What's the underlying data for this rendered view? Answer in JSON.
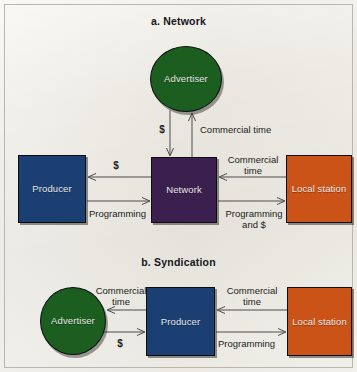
{
  "figure": {
    "background_color": "#eceae2",
    "panels": [
      {
        "id": "network",
        "title": "a. Network",
        "nodes": [
          {
            "id": "advertiser",
            "label": "Advertiser",
            "shape": "circle",
            "color": "#1b5e20"
          },
          {
            "id": "producer",
            "label": "Producer",
            "shape": "rect",
            "color": "#1c3f73"
          },
          {
            "id": "network",
            "label": "Network",
            "shape": "rect",
            "color": "#3b1f4e"
          },
          {
            "id": "local_station",
            "label": "Local\nstation",
            "shape": "rect",
            "color": "#cc5317"
          }
        ],
        "edges": [
          {
            "id": "network-to-advertiser-money",
            "label": "$",
            "from": "network",
            "to": "advertiser",
            "direction": "down"
          },
          {
            "id": "advertiser-to-network-commercial-time",
            "label": "Commercial time",
            "from": "advertiser",
            "to": "network",
            "direction": "up"
          },
          {
            "id": "network-to-producer-money",
            "label": "$",
            "from": "network",
            "to": "producer",
            "direction": "left"
          },
          {
            "id": "producer-to-network-programming",
            "label": "Programming",
            "from": "producer",
            "to": "network",
            "direction": "right"
          },
          {
            "id": "local-station-to-network-commercial-time",
            "label": "Commercial\ntime",
            "from": "local_station",
            "to": "network",
            "direction": "left"
          },
          {
            "id": "network-to-local-station-programming",
            "label": "Programming\nand $",
            "from": "network",
            "to": "local_station",
            "direction": "right"
          }
        ]
      },
      {
        "id": "syndication",
        "title": "b. Syndication",
        "nodes": [
          {
            "id": "advertiser",
            "label": "Advertiser",
            "shape": "circle",
            "color": "#1b5e20"
          },
          {
            "id": "producer",
            "label": "Producer",
            "shape": "rect",
            "color": "#1c3f73"
          },
          {
            "id": "local_station",
            "label": "Local\nstation",
            "shape": "rect",
            "color": "#cc5317"
          }
        ],
        "edges": [
          {
            "id": "producer-to-advertiser-commercial-time",
            "label": "Commercial\ntime",
            "from": "producer",
            "to": "advertiser",
            "direction": "left"
          },
          {
            "id": "advertiser-to-producer-money",
            "label": "$",
            "from": "advertiser",
            "to": "producer",
            "direction": "right"
          },
          {
            "id": "local-station-to-producer-commercial-time",
            "label": "Commercial\ntime",
            "from": "local_station",
            "to": "producer",
            "direction": "left"
          },
          {
            "id": "producer-to-local-station-programming",
            "label": "Programming",
            "from": "producer",
            "to": "local_station",
            "direction": "right"
          }
        ]
      }
    ]
  },
  "labels": {
    "network": {
      "title": "a. Network",
      "advertiser": "Advertiser",
      "producer": "Producer",
      "network": "Network",
      "local_station": "Local\nstation",
      "money_to_advertiser": "$",
      "commercial_time_from_advertiser": "Commercial time",
      "money_to_producer": "$",
      "programming_to_network": "Programming",
      "commercial_time_from_station": "Commercial\ntime",
      "programming_and_money_to_station": "Programming\nand $"
    },
    "syndication": {
      "title": "b. Syndication",
      "advertiser": "Advertiser",
      "producer": "Producer",
      "local_station": "Local\nstation",
      "commercial_time_to_advertiser": "Commercial\ntime",
      "money_to_producer": "$",
      "commercial_time_from_station": "Commercial\ntime",
      "programming_to_station": "Programming"
    }
  },
  "colors": {
    "advertiser_green": "#1b5e20",
    "producer_blue": "#1c3f73",
    "network_purple": "#3b1f4e",
    "local_station_orange": "#cc5317",
    "paper": "#eceae2",
    "arrow_gray": "#4b4c4e",
    "text_dark": "#15161a",
    "node_text": "#e8e8e6"
  }
}
